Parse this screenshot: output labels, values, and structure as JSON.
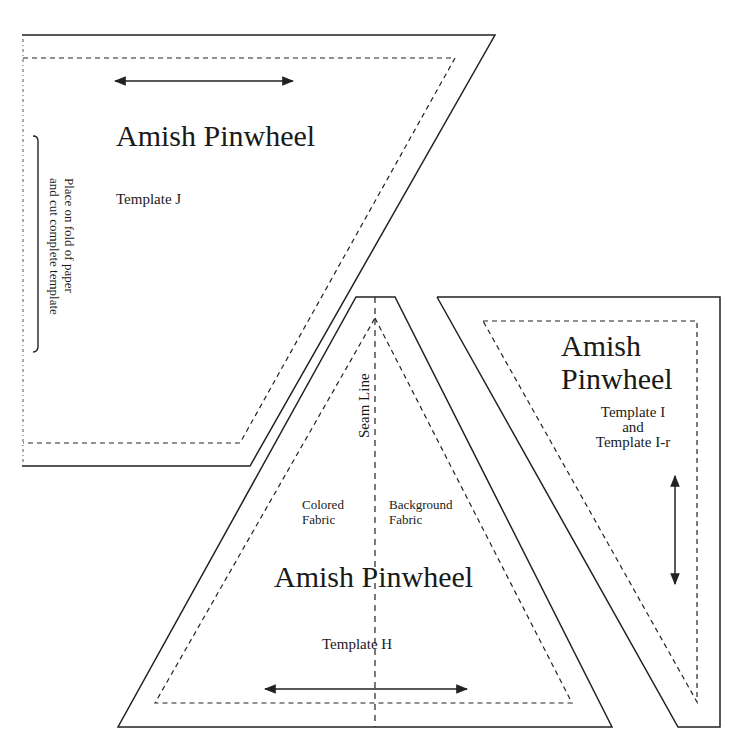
{
  "colors": {
    "line": "#222222",
    "background": "#ffffff"
  },
  "template_j": {
    "title": "Amish Pinwheel",
    "subtitle": "Template J",
    "fold_note_line1": "Place on fold of paper",
    "fold_note_line2": "and cut complete template",
    "grain_arrow": "horizontal-double-arrow"
  },
  "template_h": {
    "title": "Amish Pinwheel",
    "subtitle": "Template H",
    "seam_label": "Seam Line",
    "left_label_line1": "Colored",
    "left_label_line2": "Fabric",
    "right_label_line1": "Background",
    "right_label_line2": "Fabric",
    "grain_arrow": "horizontal-double-arrow"
  },
  "template_i": {
    "title_line1": "Amish",
    "title_line2": "Pinwheel",
    "subtitle_line1": "Template I",
    "subtitle_line2": "and",
    "subtitle_line3": "Template I-r",
    "grain_arrow": "vertical-double-arrow"
  }
}
